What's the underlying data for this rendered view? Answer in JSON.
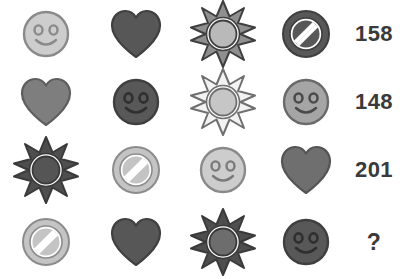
{
  "puzzle": {
    "title": "Symbol weight puzzle",
    "type": "visual-equation-grid",
    "columns": 5,
    "rows": 4,
    "background_color": "#ffffff",
    "number_color": "#3a3a3a",
    "palette": {
      "light": "#c9c9c9",
      "light_fill": "#d0d0d0",
      "medium": "#808080",
      "medium_dark": "#6d6d6d",
      "dark": "#585858",
      "darkest": "#4a4a4a",
      "outline_dark": "#3f3f3f",
      "outline_light": "#8c8c8c",
      "white": "#ffffff"
    },
    "symbol_names": {
      "smiley": "smiley-face-icon",
      "heart": "heart-icon",
      "sun": "sun-star-icon",
      "prohibition": "prohibition-sign-icon"
    },
    "rows_data": [
      {
        "row_label": "row-1",
        "cells": [
          {
            "symbol": "smiley",
            "shade": "light"
          },
          {
            "symbol": "heart",
            "shade": "dark"
          },
          {
            "symbol": "sun",
            "shade": "light"
          },
          {
            "symbol": "prohibition",
            "shade": "dark"
          }
        ],
        "result": "158"
      },
      {
        "row_label": "row-2",
        "cells": [
          {
            "symbol": "heart",
            "shade": "medium"
          },
          {
            "symbol": "smiley",
            "shade": "dark"
          },
          {
            "symbol": "sun",
            "shade": "light"
          },
          {
            "symbol": "smiley",
            "shade": "medium"
          }
        ],
        "result": "148"
      },
      {
        "row_label": "row-3",
        "cells": [
          {
            "symbol": "sun",
            "shade": "dark"
          },
          {
            "symbol": "prohibition",
            "shade": "light"
          },
          {
            "symbol": "smiley",
            "shade": "light"
          },
          {
            "symbol": "heart",
            "shade": "medium"
          }
        ],
        "result": "201"
      },
      {
        "row_label": "row-4",
        "cells": [
          {
            "symbol": "prohibition",
            "shade": "light"
          },
          {
            "symbol": "heart",
            "shade": "dark"
          },
          {
            "symbol": "sun",
            "shade": "dark"
          },
          {
            "symbol": "smiley",
            "shade": "dark"
          }
        ],
        "result": "?"
      }
    ],
    "results": [
      "158",
      "148",
      "201",
      "?"
    ]
  }
}
